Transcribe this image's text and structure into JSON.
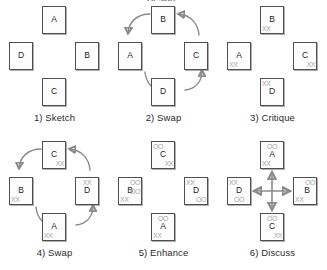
{
  "figure": {
    "title_fragment": "Design",
    "mark_glyphs": {
      "critique": "XX",
      "enhance": "OO"
    },
    "colors": {
      "card_border": "#4f4f4f",
      "card_fill": "#fdfdfd",
      "letter": "#1d1d1d",
      "mark": "#a6a6a6",
      "arrow": "#8a8a8a",
      "caption": "#2b2b2b",
      "background": "#ffffff"
    }
  },
  "panels": [
    {
      "caption": "1) Sketch",
      "flow": "none",
      "cards": [
        {
          "position": "top",
          "letter": "A",
          "marks": []
        },
        {
          "position": "left",
          "letter": "D",
          "marks": []
        },
        {
          "position": "right",
          "letter": "B",
          "marks": []
        },
        {
          "position": "bottom",
          "letter": "C",
          "marks": []
        }
      ]
    },
    {
      "caption": "2) Swap",
      "flow": "clockwise-rotate",
      "cards": [
        {
          "position": "top",
          "letter": "B",
          "marks": []
        },
        {
          "position": "left",
          "letter": "A",
          "marks": []
        },
        {
          "position": "right",
          "letter": "C",
          "marks": []
        },
        {
          "position": "bottom",
          "letter": "D",
          "marks": []
        }
      ]
    },
    {
      "caption": "3) Critique",
      "flow": "none",
      "cards": [
        {
          "position": "top",
          "letter": "B",
          "marks": [
            {
              "glyph": "XX",
              "place": "bottom-left"
            }
          ]
        },
        {
          "position": "left",
          "letter": "A",
          "marks": [
            {
              "glyph": "XX",
              "place": "bottom-left"
            }
          ]
        },
        {
          "position": "right",
          "letter": "C",
          "marks": [
            {
              "glyph": "XX",
              "place": "bottom-right"
            }
          ]
        },
        {
          "position": "bottom",
          "letter": "D",
          "marks": [
            {
              "glyph": "XX",
              "place": "top-left"
            }
          ]
        }
      ]
    },
    {
      "caption": "4) Swap",
      "flow": "clockwise-rotate",
      "cards": [
        {
          "position": "top",
          "letter": "C",
          "marks": [
            {
              "glyph": "XX",
              "place": "bottom-right"
            }
          ]
        },
        {
          "position": "left",
          "letter": "B",
          "marks": [
            {
              "glyph": "XX",
              "place": "bottom-left"
            }
          ]
        },
        {
          "position": "right",
          "letter": "D",
          "marks": [
            {
              "glyph": "XX",
              "place": "top-center"
            }
          ]
        },
        {
          "position": "bottom",
          "letter": "A",
          "marks": [
            {
              "glyph": "XX",
              "place": "bottom-left"
            }
          ]
        }
      ]
    },
    {
      "caption": "5) Enhance",
      "flow": "none",
      "cards": [
        {
          "position": "top",
          "letter": "C",
          "marks": [
            {
              "glyph": "OO",
              "place": "top-left"
            },
            {
              "glyph": "XX",
              "place": "bottom-right"
            }
          ]
        },
        {
          "position": "left",
          "letter": "B",
          "marks": [
            {
              "glyph": "OO",
              "place": "top-right"
            },
            {
              "glyph": "OO",
              "place": "middle-right"
            },
            {
              "glyph": "XX",
              "place": "bottom-left"
            }
          ]
        },
        {
          "position": "right",
          "letter": "D",
          "marks": [
            {
              "glyph": "XX",
              "place": "top-left"
            },
            {
              "glyph": "OO",
              "place": "bottom-right"
            }
          ]
        },
        {
          "position": "bottom",
          "letter": "A",
          "marks": [
            {
              "glyph": "OO",
              "place": "top-center"
            },
            {
              "glyph": "XX",
              "place": "bottom-left"
            }
          ]
        }
      ]
    },
    {
      "caption": "6) Discuss",
      "flow": "four-way-cross",
      "cards": [
        {
          "position": "top",
          "letter": "A",
          "marks": [
            {
              "glyph": "OO",
              "place": "top-center"
            },
            {
              "glyph": "XX",
              "place": "bottom-left"
            }
          ]
        },
        {
          "position": "left",
          "letter": "D",
          "marks": [
            {
              "glyph": "XX",
              "place": "top-left"
            },
            {
              "glyph": "OO",
              "place": "bottom-center"
            }
          ]
        },
        {
          "position": "right",
          "letter": "B",
          "marks": [
            {
              "glyph": "OO",
              "place": "top-right"
            },
            {
              "glyph": "XX",
              "place": "bottom-left"
            }
          ]
        },
        {
          "position": "bottom",
          "letter": "C",
          "marks": [
            {
              "glyph": "OO",
              "place": "top-center"
            },
            {
              "glyph": "XX",
              "place": "bottom-right"
            }
          ]
        }
      ]
    }
  ]
}
